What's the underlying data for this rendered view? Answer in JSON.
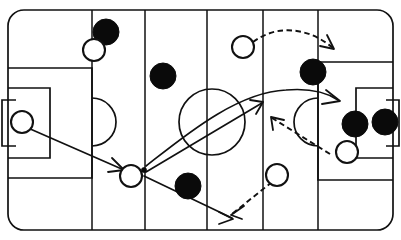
{
  "diagram": {
    "kind": "sports-play-diagram",
    "sport": "soccer",
    "width": 401,
    "height": 240,
    "background_color": "#ffffff",
    "line_color": "#111111",
    "dark_team_color": "#0a0a0a",
    "light_team_color": "#ffffff"
  },
  "pitch": {
    "outline": {
      "x": 8,
      "y": 10,
      "width": 385,
      "height": 220,
      "corner_radius": 16,
      "label": "field-boundary"
    },
    "vertical_lines": [
      {
        "name": "third-line-left",
        "x": 92
      },
      {
        "name": "quarter-line-left",
        "x": 145
      },
      {
        "name": "halfway-line",
        "x": 207
      },
      {
        "name": "quarter-line-right",
        "x": 263
      },
      {
        "name": "third-line-right",
        "x": 318
      }
    ],
    "center_circle": {
      "cx": 212,
      "cy": 122,
      "r": 33
    },
    "left_goal": {
      "penalty_area": {
        "x": 8,
        "y": 68,
        "width": 84,
        "height": 110
      },
      "goal_area": {
        "x": 8,
        "y": 88,
        "width": 42,
        "height": 70
      },
      "net": {
        "x": -4,
        "y": 100,
        "width": 20,
        "height": 46
      },
      "penalty_arc": {
        "cx": 92,
        "cy": 122,
        "r": 24
      }
    },
    "right_goal": {
      "penalty_area": {
        "x": 318,
        "y": 62,
        "width": 78,
        "height": 118
      },
      "goal_area": {
        "x": 356,
        "y": 88,
        "width": 40,
        "height": 70
      },
      "net": {
        "x": 386,
        "y": 100,
        "width": 20,
        "height": 46
      },
      "penalty_arc": {
        "cx": 318,
        "cy": 122,
        "r": 24
      }
    }
  },
  "players": {
    "dark_team_label": "dark-team-player",
    "light_team_label": "light-team-player",
    "dark": [
      {
        "id": "D1",
        "cx": 106,
        "cy": 32,
        "r": 13
      },
      {
        "id": "D2",
        "cx": 163,
        "cy": 76,
        "r": 13
      },
      {
        "id": "D3",
        "cx": 188,
        "cy": 186,
        "r": 13
      },
      {
        "id": "D4",
        "cx": 313,
        "cy": 72,
        "r": 13
      },
      {
        "id": "D5",
        "cx": 355,
        "cy": 124,
        "r": 13
      },
      {
        "id": "D6",
        "cx": 385,
        "cy": 122,
        "r": 13
      }
    ],
    "light": [
      {
        "id": "L1",
        "cx": 94,
        "cy": 50,
        "r": 11
      },
      {
        "id": "L2",
        "cx": 243,
        "cy": 47,
        "r": 11
      },
      {
        "id": "L3",
        "cx": 131,
        "cy": 176,
        "r": 11
      },
      {
        "id": "L4",
        "cx": 277,
        "cy": 175,
        "r": 11
      },
      {
        "id": "L5",
        "cx": 347,
        "cy": 152,
        "r": 11
      },
      {
        "id": "L6",
        "cx": 22,
        "cy": 122,
        "r": 11
      }
    ]
  },
  "ball": {
    "cx": 144,
    "cy": 170,
    "r": 2.6,
    "label": "ball-marker"
  },
  "movements": {
    "solid_label": "pass-or-ball-path",
    "dashed_label": "player-run-path",
    "paths": [
      {
        "id": "M1",
        "style": "solid",
        "kind": "pass",
        "description": "Goalkeeper distribution out to ball carrier",
        "d": "M 28 128 L 124 170"
      },
      {
        "id": "M2",
        "style": "solid",
        "kind": "pass",
        "description": "Long curving ball from carrier to far side",
        "d": "M 146 166 C 182 138 236 92 286 90 C 310 88 326 92 338 100"
      },
      {
        "id": "M3",
        "style": "solid",
        "kind": "pass",
        "description": "Diagonal ball into central attacking zone",
        "d": "M 146 172 L 262 103"
      },
      {
        "id": "M4",
        "style": "solid",
        "kind": "pass",
        "description": "Ball played back and down the flank",
        "d": "M 144 176 L 232 218"
      },
      {
        "id": "M5",
        "style": "dashed",
        "kind": "run",
        "description": "Forward curving run beyond the defensive line",
        "d": "M 253 42 C 280 22 312 30 333 48"
      },
      {
        "id": "M6",
        "style": "dashed",
        "kind": "run",
        "description": "Run inside toward the penalty spot",
        "d": "M 330 154 L 272 118"
      },
      {
        "id": "M7",
        "style": "dashed",
        "kind": "run",
        "description": "Supporting run dropping to the corner",
        "d": "M 272 182 L 232 214"
      }
    ],
    "arrow_heads": [
      {
        "id": "A1",
        "for": "M1",
        "d": "M 112 158 L 124 170 L 108 172"
      },
      {
        "id": "A2",
        "for": "M2",
        "d": "M 326 90 L 340 101 L 322 104"
      },
      {
        "id": "A3",
        "for": "M3",
        "d": "M 250 100 L 263 102 L 256 114"
      },
      {
        "id": "A4",
        "for": "M4",
        "d": "M 219 212 L 233 219 L 219 224"
      },
      {
        "id": "A5",
        "for": "M5",
        "d": "M 327 35 L 334 49 L 320 46"
      },
      {
        "id": "A6",
        "for": "M6",
        "d": "M 273 130 L 271 117 L 284 120"
      },
      {
        "id": "A7",
        "for": "M7",
        "d": "M 244 206 L 231 215 L 242 219"
      }
    ]
  }
}
